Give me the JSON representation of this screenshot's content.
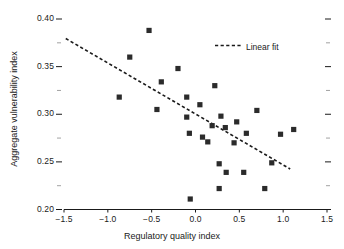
{
  "chart_data": {
    "type": "scatter",
    "title": "",
    "xlabel": "Regulatory quality index",
    "ylabel": "Aggregate vulnerability index",
    "xlim": [
      -1.5,
      1.5
    ],
    "ylim": [
      0.2,
      0.4
    ],
    "xticks": [
      "-1.5",
      "-1.0",
      "-0.5",
      "0.0",
      "0.5",
      "1.0",
      "1.5"
    ],
    "xtick_values": [
      -1.5,
      -1.0,
      -0.5,
      0.0,
      0.5,
      1.0,
      1.5
    ],
    "ytick_values": [
      0.2,
      0.25,
      0.3,
      0.35,
      0.4
    ],
    "yticks": [
      "0.20",
      "0.25",
      "0.30",
      "0.35",
      "0.40"
    ],
    "y_minor_ticks": [
      0.225,
      0.275,
      0.325,
      0.375
    ],
    "grid": false,
    "legend_position": "top-right",
    "series": [
      {
        "name": "Countries",
        "marker": "square",
        "color": "#2b2b2b",
        "points": [
          {
            "x": -0.87,
            "y": 0.318
          },
          {
            "x": -0.75,
            "y": 0.36
          },
          {
            "x": -0.53,
            "y": 0.388
          },
          {
            "x": -0.44,
            "y": 0.305
          },
          {
            "x": -0.39,
            "y": 0.334
          },
          {
            "x": -0.2,
            "y": 0.348
          },
          {
            "x": -0.1,
            "y": 0.297
          },
          {
            "x": -0.1,
            "y": 0.318
          },
          {
            "x": -0.07,
            "y": 0.28
          },
          {
            "x": -0.06,
            "y": 0.211
          },
          {
            "x": 0.05,
            "y": 0.31
          },
          {
            "x": 0.08,
            "y": 0.276
          },
          {
            "x": 0.14,
            "y": 0.271
          },
          {
            "x": 0.19,
            "y": 0.288
          },
          {
            "x": 0.22,
            "y": 0.33
          },
          {
            "x": 0.27,
            "y": 0.248
          },
          {
            "x": 0.27,
            "y": 0.222
          },
          {
            "x": 0.29,
            "y": 0.298
          },
          {
            "x": 0.34,
            "y": 0.286
          },
          {
            "x": 0.35,
            "y": 0.239
          },
          {
            "x": 0.44,
            "y": 0.27
          },
          {
            "x": 0.47,
            "y": 0.292
          },
          {
            "x": 0.55,
            "y": 0.239
          },
          {
            "x": 0.58,
            "y": 0.28
          },
          {
            "x": 0.7,
            "y": 0.304
          },
          {
            "x": 0.79,
            "y": 0.222
          },
          {
            "x": 0.87,
            "y": 0.249
          },
          {
            "x": 0.97,
            "y": 0.279
          },
          {
            "x": 1.12,
            "y": 0.284
          }
        ]
      }
    ],
    "fit_line": {
      "name": "Linear fit",
      "style": "dashed",
      "color": "#1a1a1a",
      "x_start": -1.48,
      "y_start": 0.3795,
      "x_end": 1.08,
      "y_end": 0.2425
    }
  },
  "legend": {
    "label": "Linear fit"
  }
}
